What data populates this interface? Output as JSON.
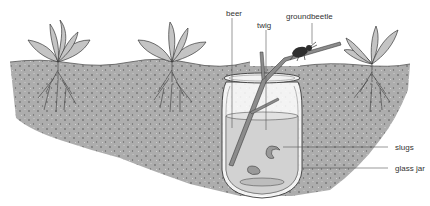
{
  "diagram": {
    "labels": {
      "beer": "beer",
      "twig": "twig",
      "groundbeetle": "groundbeetle",
      "slugs": "slugs",
      "glass_jar": "glass jar"
    },
    "elements": [
      "plant",
      "plant",
      "plant",
      "soil",
      "glass jar",
      "beer",
      "twig",
      "groundbeetle",
      "slug",
      "slug"
    ],
    "colors": {
      "soil": "#a8a8a8",
      "soil_dark": "#7a7a7a",
      "leaf": "#c4c4c4",
      "leaf_dark": "#8e8e8e",
      "outline": "#3a3a3a",
      "beer": "#cfcfcf",
      "leader_line": "#555555"
    }
  }
}
